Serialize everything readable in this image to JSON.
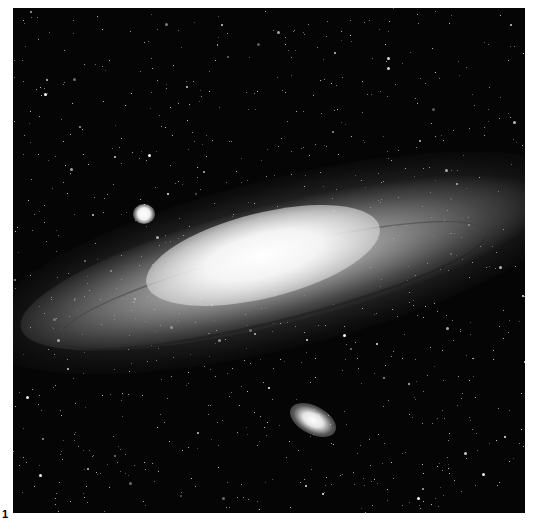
{
  "figure": {
    "label": "1",
    "colors": {
      "background": "#ffffff",
      "sky": "#050505",
      "core": "#ffffff"
    }
  }
}
